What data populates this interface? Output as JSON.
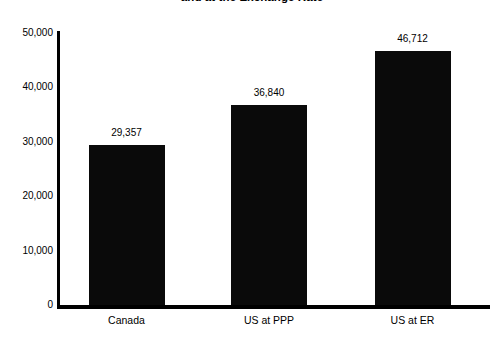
{
  "chart_data": {
    "type": "bar",
    "title": "and at the Exchange Rate",
    "title_note": "title is clipped at the top edge of the screenshot",
    "xlabel": "",
    "ylabel": "",
    "categories": [
      "Canada",
      "US at PPP",
      "US at ER"
    ],
    "values": [
      29357,
      36840,
      46712
    ],
    "value_labels": [
      "29,357",
      "36,840",
      "46,712"
    ],
    "ylim": [
      0,
      50000
    ],
    "ytick_values": [
      0,
      10000,
      20000,
      30000,
      40000,
      50000
    ],
    "ytick_labels": [
      "0",
      "10,000",
      "20,000",
      "30,000",
      "40,000",
      "50,000"
    ],
    "grid": false,
    "legend": false,
    "legend_position": "none",
    "bar_color": "#0a0a0a",
    "axis_color": "#000000",
    "background_color": "#ffffff"
  }
}
